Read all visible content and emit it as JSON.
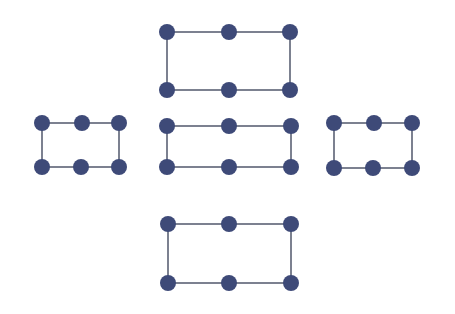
{
  "diagram": {
    "width": 455,
    "height": 314,
    "background": "#ffffff",
    "node_color": "#3e4a78",
    "edge_color": "#7c8190",
    "node_radius": 8,
    "edge_width": 2,
    "shapes": [
      {
        "name": "top-rectangle",
        "nodes": [
          [
            167,
            32
          ],
          [
            229,
            32
          ],
          [
            290,
            32
          ],
          [
            290,
            90
          ],
          [
            229,
            90
          ],
          [
            167,
            90
          ]
        ]
      },
      {
        "name": "left-rectangle",
        "nodes": [
          [
            42,
            123
          ],
          [
            82,
            123
          ],
          [
            119,
            123
          ],
          [
            119,
            167
          ],
          [
            81,
            167
          ],
          [
            42,
            167
          ]
        ]
      },
      {
        "name": "center-rectangle",
        "nodes": [
          [
            167,
            126
          ],
          [
            229,
            126
          ],
          [
            291,
            126
          ],
          [
            291,
            167
          ],
          [
            229,
            167
          ],
          [
            167,
            167
          ]
        ]
      },
      {
        "name": "right-rectangle",
        "nodes": [
          [
            334,
            123
          ],
          [
            374,
            123
          ],
          [
            412,
            123
          ],
          [
            412,
            168
          ],
          [
            373,
            168
          ],
          [
            334,
            168
          ]
        ]
      },
      {
        "name": "bottom-rectangle",
        "nodes": [
          [
            168,
            224
          ],
          [
            229,
            224
          ],
          [
            291,
            224
          ],
          [
            291,
            283
          ],
          [
            229,
            283
          ],
          [
            168,
            283
          ]
        ]
      }
    ]
  }
}
